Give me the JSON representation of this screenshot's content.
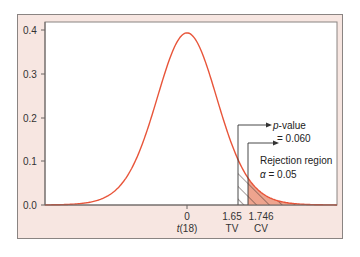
{
  "chart_data": {
    "type": "line",
    "title": "",
    "distribution": "t(18)",
    "df": 18,
    "xlabel": "t(18)",
    "ylabel": "",
    "ylim": [
      0.0,
      0.4
    ],
    "grid": false,
    "legend": null,
    "y_ticks": [
      {
        "value": 0.0,
        "label": "0.0"
      },
      {
        "value": 0.1,
        "label": "0.1"
      },
      {
        "value": 0.2,
        "label": "0.2"
      },
      {
        "value": 0.3,
        "label": "0.3"
      },
      {
        "value": 0.4,
        "label": "0.4"
      }
    ],
    "x_ticks": [
      {
        "value": 0,
        "label": "0",
        "sublabel": "t(18)"
      },
      {
        "value": 1.65,
        "label": "1.65",
        "sublabel": "TV"
      },
      {
        "value": 1.746,
        "label": "1.746",
        "sublabel": "CV"
      }
    ],
    "series": [
      {
        "name": "t-distribution density, df=18",
        "color": "#e8553a",
        "peak": 0.394
      }
    ],
    "regions": [
      {
        "name": "p-value",
        "from": 1.65,
        "to": "inf",
        "area": 0.06,
        "style": "hatched"
      },
      {
        "name": "Rejection region",
        "from": 1.746,
        "to": "inf",
        "area": 0.05,
        "style": "hatched-filled",
        "fill": "#eea48e"
      }
    ],
    "annotations": [
      {
        "text_italic": "p",
        "text": "-value",
        "line2": "= 0.060",
        "arrow_from": 1.65
      },
      {
        "text": "Rejection region",
        "line2_symbol": "α",
        "line2": " = 0.05",
        "arrow_from": 1.746
      }
    ]
  },
  "labels": {
    "y": [
      "0.0",
      "0.1",
      "0.2",
      "0.3",
      "0.4"
    ],
    "x0": "0",
    "x0_sub_italic": "t",
    "x0_sub": "(18)",
    "tv_value": "1.65",
    "tv": "TV",
    "cv_value": "1.746",
    "cv": "CV",
    "pvalue_italic": "p",
    "pvalue_text": "-value",
    "pvalue_eq": "= 0.060",
    "rejection": "Rejection region",
    "alpha_symbol": "α",
    "alpha_eq": " = 0.05"
  },
  "colors": {
    "frame_bg": "#f7e6e1",
    "curve": "#e8553a",
    "fill": "#eea48e",
    "hatch": "#3a2a28",
    "axis": "#6b6563"
  }
}
